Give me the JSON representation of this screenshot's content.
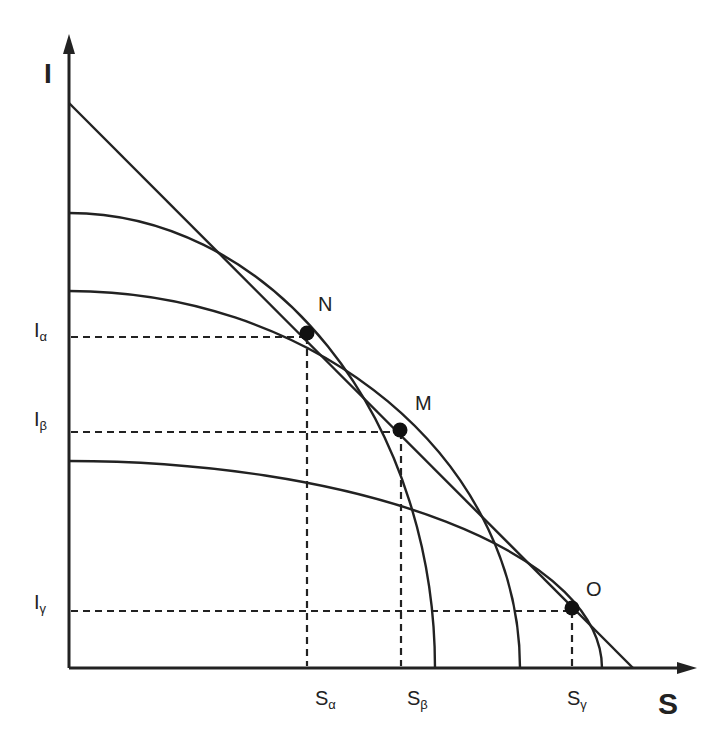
{
  "diagram": {
    "axes": {
      "y_label": "I",
      "x_label": "S"
    },
    "points": [
      {
        "id": "N",
        "label": "N",
        "x": 307,
        "y": 333
      },
      {
        "id": "M",
        "label": "M",
        "x": 400,
        "y": 430
      },
      {
        "id": "O",
        "label": "O",
        "x": 572,
        "y": 608
      }
    ],
    "y_ticks": [
      {
        "base": "I",
        "sub": "α"
      },
      {
        "base": "I",
        "sub": "β"
      },
      {
        "base": "I",
        "sub": "γ"
      }
    ],
    "x_ticks": [
      {
        "base": "S",
        "sub": "α"
      },
      {
        "base": "S",
        "sub": "β"
      },
      {
        "base": "S",
        "sub": "γ"
      }
    ],
    "curves": [
      {
        "name": "curve-alpha",
        "y_intercept": 213,
        "x_intercept": 435,
        "tangent_point": "N"
      },
      {
        "name": "curve-beta",
        "y_intercept": 291,
        "x_intercept": 520,
        "tangent_point": "M"
      },
      {
        "name": "curve-gamma",
        "y_intercept": 461,
        "x_intercept": 602,
        "tangent_point": "O"
      }
    ],
    "envelope_line": {
      "from": [
        69,
        103
      ],
      "to": [
        633,
        668
      ]
    },
    "colors": {
      "ink": "#222222",
      "background": "#ffffff"
    }
  }
}
